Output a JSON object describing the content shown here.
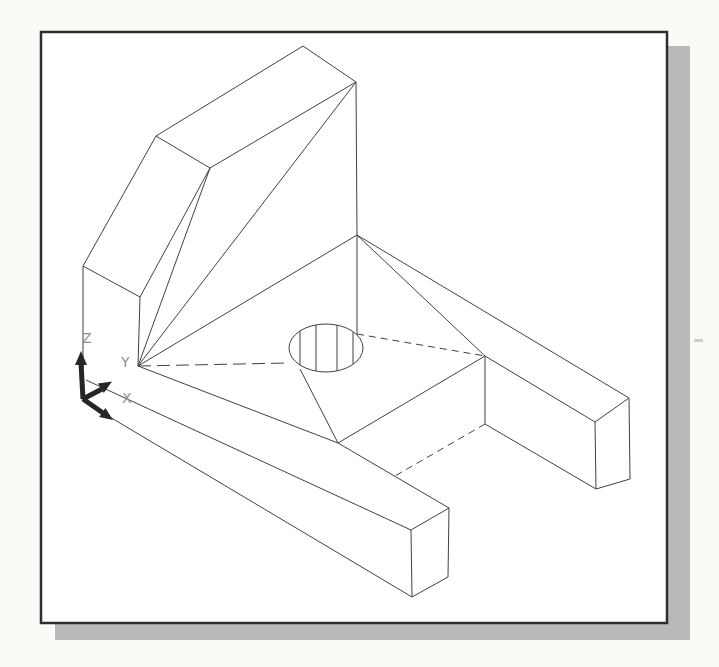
{
  "page": {
    "background": "#fafaf7"
  },
  "figure": {
    "frame": {
      "x": 41,
      "y": 32,
      "w": 626,
      "h": 591,
      "border_color": "#2e2e2e",
      "fill": "#ffffff",
      "border_width": 2.5
    },
    "shadow": {
      "color": "#b9b9b9",
      "rects": [
        {
          "x": 668,
          "y": 46,
          "w": 22,
          "h": 594
        },
        {
          "x": 55,
          "y": 624,
          "w": 635,
          "h": 16
        }
      ]
    },
    "artifact": {
      "x": 694,
      "y": 339,
      "w": 9,
      "h": 3,
      "color": "#cccccc"
    },
    "line_color": "#414141",
    "line_width": 1,
    "segments_solid": [
      [
        83,
        266,
        156,
        136
      ],
      [
        156,
        136,
        303,
        46
      ],
      [
        303,
        46,
        356,
        82
      ],
      [
        156,
        136,
        210,
        168
      ],
      [
        210,
        168,
        356,
        82
      ],
      [
        83,
        266,
        83,
        401
      ],
      [
        83,
        266,
        140,
        297
      ],
      [
        140,
        297,
        210,
        168
      ],
      [
        140,
        297,
        138,
        366
      ],
      [
        210,
        168,
        138,
        366
      ],
      [
        356,
        82,
        138,
        366
      ],
      [
        356,
        82,
        357,
        235
      ],
      [
        357,
        235,
        138,
        366
      ],
      [
        357,
        235,
        357,
        334
      ],
      [
        357,
        235,
        485,
        356
      ],
      [
        357,
        235,
        629,
        398
      ],
      [
        138,
        366,
        338,
        443
      ],
      [
        300,
        369,
        338,
        443
      ],
      [
        338,
        443,
        485,
        356
      ],
      [
        485,
        356,
        485,
        424
      ],
      [
        485,
        356,
        595,
        422
      ],
      [
        485,
        424,
        596,
        489
      ],
      [
        595,
        422,
        629,
        398
      ],
      [
        595,
        422,
        596,
        489
      ],
      [
        629,
        398,
        630,
        479
      ],
      [
        596,
        489,
        630,
        479
      ],
      [
        338,
        443,
        449,
        508
      ],
      [
        86,
        380,
        411,
        530
      ],
      [
        83,
        401,
        412,
        597
      ],
      [
        411,
        530,
        449,
        508
      ],
      [
        411,
        530,
        412,
        597
      ],
      [
        449,
        508,
        448,
        577
      ],
      [
        412,
        597,
        448,
        577
      ],
      [
        300,
        331,
        300,
        365
      ],
      [
        316,
        325,
        316,
        371
      ],
      [
        337,
        325,
        337,
        371
      ],
      [
        353,
        332,
        353,
        364
      ]
    ],
    "segments_dashed": [
      {
        "pts": [
          138,
          366,
          289,
          363
        ],
        "dash": "13 6"
      },
      {
        "pts": [
          357,
          334,
          485,
          356
        ],
        "dash": "7 5"
      },
      {
        "pts": [
          485,
          424,
          395,
          476
        ],
        "dash": "7 5"
      }
    ],
    "hole_ellipse": {
      "cx": 326,
      "cy": 348,
      "rx": 37,
      "ry": 24
    }
  },
  "ucs": {
    "labels": {
      "x": "X",
      "y": "Y",
      "z": "Z"
    },
    "color": "#262626",
    "shaft_width": 5,
    "arrows": [
      {
        "name": "z-axis-arrow",
        "shaft": [
          83,
          399,
          81,
          363
        ],
        "head": [
          [
            81,
            351
          ],
          [
            75,
            365
          ],
          [
            87,
            365
          ]
        ]
      },
      {
        "name": "y-axis-arrow",
        "shaft": [
          83,
          399,
          102,
          389
        ],
        "head": [
          [
            112,
            381.5
          ],
          [
            103.8,
            392.9
          ],
          [
            98,
            383.5
          ]
        ]
      },
      {
        "name": "x-axis-arrow",
        "shaft": [
          83,
          399,
          103,
          413
        ],
        "head": [
          [
            113,
            420
          ],
          [
            99.2,
            417.1
          ],
          [
            105.4,
            408.1
          ]
        ]
      }
    ]
  }
}
